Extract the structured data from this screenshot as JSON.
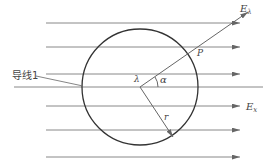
{
  "diagram": {
    "type": "physics-field-diagram",
    "colors": {
      "line": "#888888",
      "circle": "#333333",
      "text": "#444444"
    },
    "labels": {
      "conductor": "导线1",
      "field_radial": "E",
      "field_radial_sub": "λ",
      "field_uniform": "E",
      "field_uniform_sub": "x",
      "point": "P",
      "angle": "α",
      "charge": "λ",
      "radius": "r"
    },
    "field_lines_y": [
      23,
      47,
      74,
      106,
      130,
      157
    ],
    "axis_y": 87,
    "circle": {
      "cx": 140,
      "cy": 87,
      "r": 58
    }
  }
}
